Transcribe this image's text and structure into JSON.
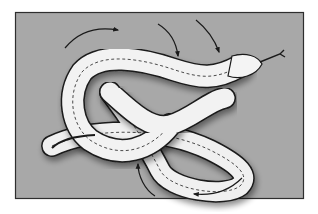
{
  "figure": {
    "title": "",
    "colors": {
      "background_panel": "#a9a9a9",
      "panel_border": "#333333",
      "snake_body": "#f2f2f2",
      "snake_shadow": "#8e8e8e",
      "outline": "#1a1a1a",
      "arrow": "#1a1a1a"
    },
    "arrows": [
      {
        "id": "arrow-top-left",
        "direction": "clockwise-right"
      },
      {
        "id": "arrow-top-middle",
        "direction": "down"
      },
      {
        "id": "arrow-top-right",
        "direction": "down"
      },
      {
        "id": "arrow-bottom-middle",
        "direction": "up"
      },
      {
        "id": "arrow-bottom-right",
        "direction": "left"
      }
    ],
    "subject": {
      "name": "snake",
      "pose": "figure-eight coil",
      "head_position": "upper-right",
      "tail_position": "lower-left",
      "tongue": "forked"
    }
  }
}
